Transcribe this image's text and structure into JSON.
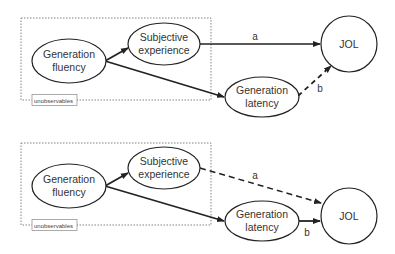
{
  "panels": [
    {
      "id": "top",
      "group_label": "unobservables",
      "nodes": {
        "fluency": {
          "line1": "Generation",
          "line2": "fluency"
        },
        "experience": {
          "line1": "Subjective",
          "line2": "experience"
        },
        "latency": {
          "line1": "Generation",
          "line2": "latency"
        },
        "jol": {
          "label": "JOL"
        }
      },
      "edges": {
        "a": {
          "label": "a",
          "from": "Subjective experience",
          "to": "JOL",
          "style": "solid"
        },
        "b": {
          "label": "b",
          "from": "Generation latency",
          "to": "JOL",
          "style": "dashed"
        }
      }
    },
    {
      "id": "bottom",
      "group_label": "unobservables",
      "nodes": {
        "fluency": {
          "line1": "Generation",
          "line2": "fluency"
        },
        "experience": {
          "line1": "Subjective",
          "line2": "experience"
        },
        "latency": {
          "line1": "Generation",
          "line2": "latency"
        },
        "jol": {
          "label": "JOL"
        }
      },
      "edges": {
        "a": {
          "label": "a",
          "from": "Subjective experience",
          "to": "JOL",
          "style": "dashed"
        },
        "b": {
          "label": "b",
          "from": "Generation latency",
          "to": "JOL",
          "style": "solid"
        }
      }
    }
  ],
  "colors": {
    "stroke": "#222222",
    "text": "#333333",
    "dotted_box": "#777777"
  }
}
